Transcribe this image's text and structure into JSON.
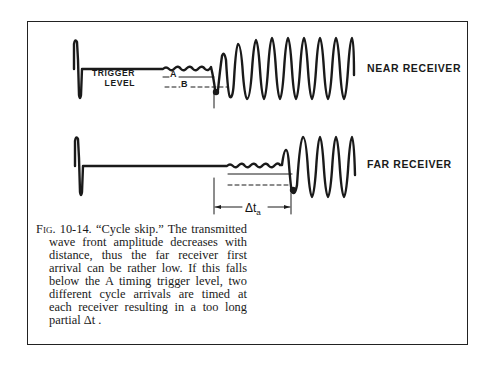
{
  "figure": {
    "number": "Fig. 10-14.",
    "title": "“Cycle skip.”",
    "caption_body": "The transmitted wave front amplitude decreases with distance, thus the far receiver first arrival can be rather low. If this falls below the A timing trigger level, two different cycle arrivals are timed at each receiver resulting in a too long partial Δt ."
  },
  "traces": {
    "near": {
      "label": "NEAR RECEIVER",
      "baseline_y": 69,
      "transmit_pulse_x": 76
    },
    "far": {
      "label": "FAR RECEIVER",
      "baseline_y": 166,
      "transmit_pulse_x": 77
    }
  },
  "trigger": {
    "label_line1": "TRIGGER",
    "label_line2": "LEVEL",
    "level_a": "A",
    "level_b": "B"
  },
  "interval": {
    "symbol": "Δt",
    "subscript": "a"
  },
  "colors": {
    "ink": "#1a1a1a",
    "paper": "#ffffff"
  }
}
